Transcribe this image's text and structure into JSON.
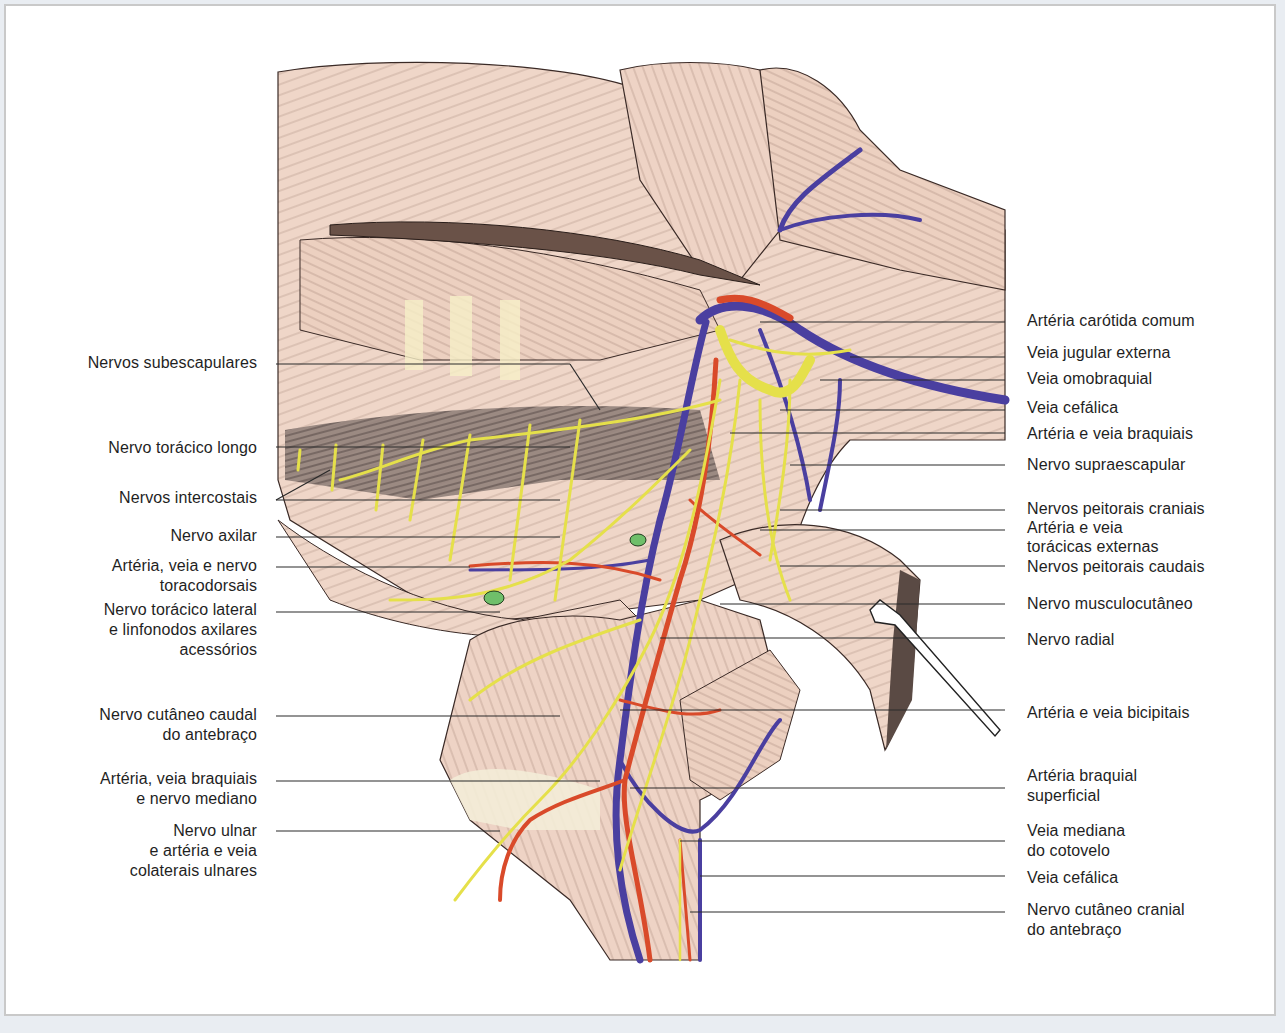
{
  "figure": {
    "colors": {
      "muscle": "#efd3c4",
      "muscle_accent": "#e6a68c",
      "vein": "#4a3fa0",
      "artery": "#d94a2a",
      "nerve": "#ecec5a",
      "lymph_node": "#6fbf6a",
      "leader_line": "#2a2a2a",
      "text": "#1f1f1f",
      "frame_border": "#c9c9c9",
      "page_bg": "#e9edf2"
    }
  },
  "labels_left": [
    {
      "id": "nervos-subescapulares",
      "lines": [
        "Nervos subescapulares"
      ],
      "y": 363
    },
    {
      "id": "nervo-toracico-longo",
      "lines": [
        "Nervo torácico longo"
      ],
      "y": 448
    },
    {
      "id": "nervos-intercostais",
      "lines": [
        "Nervos intercostais"
      ],
      "y": 498
    },
    {
      "id": "nervo-axilar",
      "lines": [
        "Nervo axilar"
      ],
      "y": 536
    },
    {
      "id": "arteria-veia-nervo-toracodorsais",
      "lines": [
        "Artéria, veia e nervo",
        "toracodorsais"
      ],
      "y": 566
    },
    {
      "id": "nervo-toracico-lateral",
      "lines": [
        "Nervo torácico lateral",
        "e linfonodos axilares",
        "acessórios"
      ],
      "y": 610
    },
    {
      "id": "nervo-cutaneo-caudal-antebraco",
      "lines": [
        "Nervo cutâneo caudal",
        "do antebraço"
      ],
      "y": 715
    },
    {
      "id": "arteria-veia-braquiais-nervo-mediano",
      "lines": [
        "Artéria, veia braquiais",
        "e nervo mediano"
      ],
      "y": 779
    },
    {
      "id": "nervo-ulnar-arteria-veia-colaterais",
      "lines": [
        "Nervo ulnar",
        "e artéria e veia",
        "colaterais ulnares"
      ],
      "y": 831
    }
  ],
  "labels_right": [
    {
      "id": "arteria-carotida-comum",
      "lines": [
        "Artéria carótida comum"
      ],
      "y": 321
    },
    {
      "id": "veia-jugular-externa",
      "lines": [
        "Veia jugular externa"
      ],
      "y": 353
    },
    {
      "id": "veia-omobraquial",
      "lines": [
        "Veia omobraquial"
      ],
      "y": 379
    },
    {
      "id": "veia-cefalica-1",
      "lines": [
        "Veia cefálica"
      ],
      "y": 408
    },
    {
      "id": "arteria-veia-braquiais",
      "lines": [
        "Artéria e veia braquiais"
      ],
      "y": 434
    },
    {
      "id": "nervo-supraescapular",
      "lines": [
        "Nervo supraescapular"
      ],
      "y": 465
    },
    {
      "id": "nervos-peitorais-craniais",
      "lines": [
        "Nervos peitorais craniais"
      ],
      "y": 509
    },
    {
      "id": "arteria-veia-toracicas-externas",
      "lines": [
        "Artéria e veia",
        "torácicas externas"
      ],
      "y": 530
    },
    {
      "id": "nervos-peitorais-caudais",
      "lines": [
        "Nervos peitorais caudais"
      ],
      "y": 567
    },
    {
      "id": "nervo-musculocutaneo",
      "lines": [
        "Nervo musculocutâneo"
      ],
      "y": 604
    },
    {
      "id": "nervo-radial",
      "lines": [
        "Nervo radial"
      ],
      "y": 640
    },
    {
      "id": "arteria-veia-bicipitais",
      "lines": [
        "Artéria e veia bicipitais"
      ],
      "y": 713
    },
    {
      "id": "arteria-braquial-superficial",
      "lines": [
        "Artéria braquial",
        "superficial"
      ],
      "y": 776
    },
    {
      "id": "veia-mediana-cotovelo",
      "lines": [
        "Veia mediana",
        "do cotovelo"
      ],
      "y": 831
    },
    {
      "id": "veia-cefalica-2",
      "lines": [
        "Veia cefálica"
      ],
      "y": 878
    },
    {
      "id": "nervo-cutaneo-cranial-antebraco",
      "lines": [
        "Nervo cutâneo cranial",
        "do antebraço"
      ],
      "y": 910
    }
  ]
}
